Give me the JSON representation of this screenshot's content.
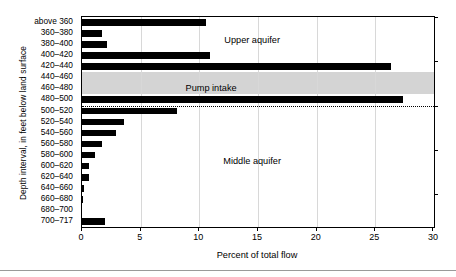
{
  "chart_data": {
    "type": "bar",
    "orientation": "horizontal",
    "title": "",
    "xlabel": "Percent of total flow",
    "ylabel": "Depth interval, in feet below land surface",
    "xlim": [
      0,
      30
    ],
    "ylim_categories_top_to_bottom": true,
    "xticks": [
      0,
      5,
      10,
      15,
      20,
      25,
      30
    ],
    "xtick_labels": [
      "0",
      "5",
      "10",
      "15",
      "20",
      "25",
      "30"
    ],
    "grid": "vertical-light",
    "legend": "none",
    "categories": [
      "above 360",
      "360–380",
      "380–400",
      "400–420",
      "420–440",
      "440–460",
      "460–480",
      "480–500",
      "500–520",
      "520–540",
      "540–560",
      "560–580",
      "580–600",
      "600–620",
      "620–640",
      "640–660",
      "660–680",
      "680–700",
      "700–717"
    ],
    "values": [
      10.6,
      1.7,
      2.1,
      10.9,
      26.3,
      0.0,
      0.0,
      27.4,
      8.1,
      3.6,
      2.9,
      1.7,
      1.1,
      0.6,
      0.6,
      0.2,
      0.1,
      0.0,
      2.0
    ],
    "bar_color": "#000000",
    "annotations": [
      {
        "name": "upper-aquifer",
        "text": "Upper aquifer",
        "x_percent": 14.5,
        "category_index": 1.6
      },
      {
        "name": "pump-intake",
        "text": "Pump intake",
        "x_percent": 11.0,
        "category_index": 6.0
      },
      {
        "name": "middle-aquifer",
        "text": "Middle aquifer",
        "x_percent": 14.5,
        "category_index": 12.6
      }
    ],
    "shaded_band": {
      "label": "Pump intake",
      "from_category": "440–460",
      "to_category": "460–480",
      "color": "#d4d4d4"
    },
    "dotted_boundary_after_category": "480–500"
  }
}
